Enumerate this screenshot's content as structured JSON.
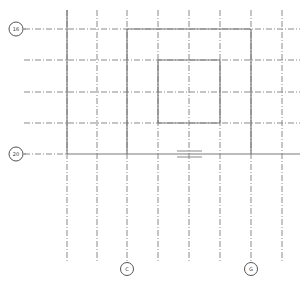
{
  "drawing": {
    "type": "structural-grid-plan",
    "line_color": "#8a8a8a",
    "solid_color": "#7a7a7a",
    "grid_bubbles": {
      "rows": [
        {
          "label": "16",
          "y": 29
        },
        {
          "label": "20",
          "y": 154
        }
      ],
      "columns": [
        {
          "label": "C",
          "x": 127
        },
        {
          "label": "G",
          "x": 251
        }
      ]
    },
    "vertical_grid_x": [
      67,
      97,
      127,
      158,
      189,
      220,
      251,
      282
    ],
    "horizontal_grid_y": [
      29,
      60,
      92,
      123,
      154
    ]
  }
}
